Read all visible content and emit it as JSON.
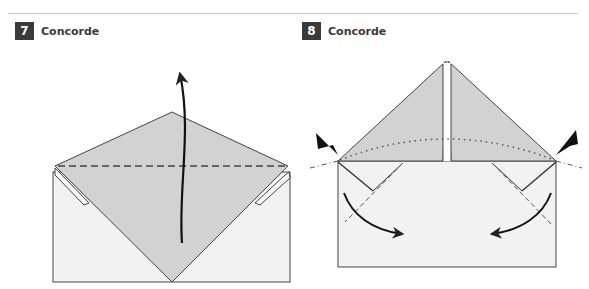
{
  "steps": [
    {
      "number": "7",
      "title": "Concorde"
    },
    {
      "number": "8",
      "title": "Concorde"
    }
  ],
  "colors": {
    "paper_front": "#d2d2d2",
    "paper_back": "#f2f2f2",
    "line": "#333333",
    "badge_bg": "#3a3a3a",
    "rule": "#c8c8c8"
  },
  "diagrams": [
    {
      "step": "7",
      "instructions": [
        "valley-fold-line",
        "fold-up-arrow"
      ]
    },
    {
      "step": "8",
      "instructions": [
        "squash-fold-pointers",
        "mountain-fold-lines",
        "valley-fold-lines",
        "fold-down-arrows"
      ]
    }
  ]
}
